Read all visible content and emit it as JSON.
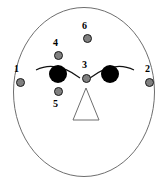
{
  "figure": {
    "title": "",
    "background_color": "#ffffff",
    "outline_color": "#6e6e6e",
    "pupil_color": "#000000",
    "marker_fill_color": "#808080",
    "marker_stroke_color": "#1a1a1a",
    "label_color": "#000000",
    "face": {
      "shape_name": "face-oval",
      "center_x": 84,
      "center_y": 92,
      "radius_x": 71,
      "radius_y": 85
    },
    "nose": {
      "shape_name": "nose-triangle",
      "apex_x": 86,
      "apex_y": 88,
      "left_x": 73,
      "right_x": 99,
      "base_y": 120
    },
    "eyes": [
      {
        "name": "left-pupil",
        "cx": 58,
        "cy": 74,
        "r": 9
      },
      {
        "name": "right-pupil",
        "cx": 110,
        "cy": 74,
        "r": 9
      }
    ],
    "brows": [
      {
        "name": "left-brow-arc",
        "d": "M 36 70 Q 56 60 80 78"
      },
      {
        "name": "right-brow-arc",
        "d": "M 90 78 Q 114 60 134 70"
      }
    ],
    "markers": [
      {
        "id": "1",
        "label": "1",
        "x": 16,
        "y": 78,
        "label_x": 14,
        "label_y": 64
      },
      {
        "id": "2",
        "label": "2",
        "x": 145,
        "y": 78,
        "label_x": 145,
        "label_y": 64
      },
      {
        "id": "3",
        "label": "3",
        "x": 82,
        "y": 74,
        "label_x": 82,
        "label_y": 60
      },
      {
        "id": "4",
        "label": "4",
        "x": 54,
        "y": 51,
        "label_x": 53,
        "label_y": 38
      },
      {
        "id": "5",
        "label": "5",
        "x": 54,
        "y": 87,
        "label_x": 53,
        "label_y": 99
      },
      {
        "id": "6",
        "label": "6",
        "x": 83,
        "y": 34,
        "label_x": 82,
        "label_y": 21
      }
    ]
  }
}
